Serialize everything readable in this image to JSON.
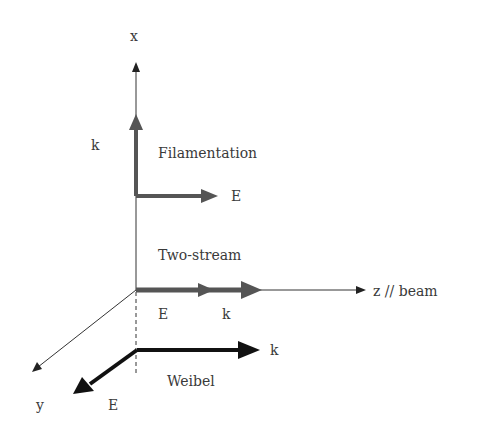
{
  "diagram": {
    "type": "3d-axes-instability-geometry",
    "colors": {
      "background": "#ffffff",
      "axis": "#333333",
      "filamentation_arrows": "#555555",
      "two_stream_arrows": "#555555",
      "weibel_arrows": "#111111",
      "text": "#3a3a3a"
    },
    "axes": {
      "x": {
        "label": "x"
      },
      "y": {
        "label": "y"
      },
      "z": {
        "label": "z  // beam"
      }
    },
    "modes": [
      {
        "name": "Filamentation",
        "k_label": "k",
        "E_label": "E",
        "description": "k along x, E along z"
      },
      {
        "name": "Two-stream",
        "k_label": "k",
        "E_label": "E",
        "description": "k and E both along z"
      },
      {
        "name": "Weibel",
        "k_label": "k",
        "E_label": "E",
        "description": "k along z, E along y"
      }
    ]
  }
}
